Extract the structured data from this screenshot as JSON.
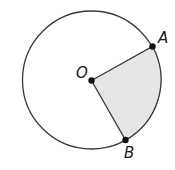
{
  "diagram": {
    "type": "circle-sector",
    "colors": {
      "stroke": "#3a3a3a",
      "sector_fill": "#e6e6e6",
      "point": "#111111",
      "background": "#ffffff"
    },
    "circle": {
      "cx": 91.5,
      "cy": 80,
      "r": 69
    },
    "points": {
      "O": {
        "label": "O",
        "x": 91.5,
        "y": 80.5,
        "label_x": 76,
        "label_y": 78
      },
      "A": {
        "label": "A",
        "x": 152.5,
        "y": 46.5,
        "label_x": 158,
        "label_y": 43
      },
      "B": {
        "label": "B",
        "x": 125.5,
        "y": 140,
        "label_x": 124,
        "label_y": 158
      }
    },
    "shaded_region": "sector OAB"
  }
}
